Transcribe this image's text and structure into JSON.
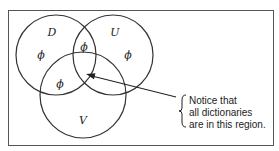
{
  "diagram": {
    "sets": [
      {
        "name": "D",
        "cx": 56,
        "cy": 55,
        "r": 40,
        "label_x": 52,
        "label_y": 36
      },
      {
        "name": "U",
        "cx": 113,
        "cy": 55,
        "r": 40,
        "label_x": 115,
        "label_y": 36
      },
      {
        "name": "V",
        "cx": 83,
        "cy": 95,
        "r": 43,
        "label_x": 83,
        "label_y": 124
      }
    ],
    "region_marks": [
      {
        "region": "D only",
        "symbol": "ϕ",
        "x": 41,
        "y": 59
      },
      {
        "region": "D and U",
        "symbol": "ϕ",
        "x": 84,
        "y": 51
      },
      {
        "region": "U only",
        "symbol": "ϕ",
        "x": 128,
        "y": 59
      },
      {
        "region": "D and V",
        "symbol": "ϕ",
        "x": 60,
        "y": 88
      }
    ],
    "annotation": {
      "lines": [
        "Notice that",
        "all dictionaries",
        "are in this region."
      ],
      "arrow_from": [
        176,
        97
      ],
      "arrow_to": [
        86,
        74
      ]
    },
    "stroke_color": "#333333"
  }
}
